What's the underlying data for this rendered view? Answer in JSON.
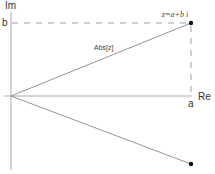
{
  "diagram": {
    "type": "complex-plane",
    "axes": {
      "x_label": "Re",
      "y_label": "Im",
      "color": "#999999"
    },
    "ticks": {
      "a_label": "a",
      "b_label": "b"
    },
    "point": {
      "label": "z=a+b i",
      "color": "#111111"
    },
    "conjugate_point": {
      "color": "#111111"
    },
    "modulus_label": "Abs[z]",
    "line_color": "#888888",
    "dash_color": "#777777"
  }
}
